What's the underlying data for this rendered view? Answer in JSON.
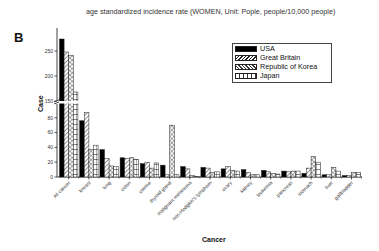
{
  "figure": {
    "panel_label": "B",
    "title": "age standardized incidence rate (WOMEN, Unit: Pople, people/10,000 people)"
  },
  "chart_data": {
    "type": "bar",
    "title": "age standardized incidence rate (WOMEN, Unit: Pople, people/10,000 people)",
    "xlabel": "Cancer",
    "ylabel": "Case",
    "axis_break": {
      "from": 100,
      "to": 150
    },
    "y_ticks_lower": [
      0,
      20,
      40,
      60,
      80
    ],
    "y_ticks_upper": [
      150,
      200,
      250
    ],
    "ylim": [
      0,
      280
    ],
    "grid": false,
    "legend_position": "upper right",
    "categories": [
      "All cancer",
      "breast",
      "lung",
      "colon",
      "uterine",
      "thyroid gland",
      "malignant melanoma",
      "non-Hodgkin's lymphom",
      "ovary",
      "kidney",
      "leukemia",
      "pancreas",
      "stomach",
      "liver",
      "gallbladder"
    ],
    "series": [
      {
        "name": "USA",
        "pattern": "solid-black",
        "values": [
          274,
          76,
          37,
          26,
          18,
          16,
          14,
          13,
          11,
          10,
          9,
          8,
          5,
          3,
          2
        ]
      },
      {
        "name": "Great Britain",
        "pattern": "diagonal-hatch",
        "values": [
          248,
          87,
          25,
          25,
          20,
          3,
          11,
          12,
          14,
          6,
          7,
          7,
          12,
          3,
          2
        ]
      },
      {
        "name": "Republic of Korea",
        "pattern": "cross-hatch",
        "values": [
          241,
          37,
          15,
          26,
          12,
          70,
          2,
          6,
          9,
          3,
          5,
          8,
          28,
          13,
          6
        ]
      },
      {
        "name": "Japan",
        "pattern": "vertical-lines",
        "values": [
          168,
          43,
          14,
          24,
          19,
          3,
          1,
          7,
          8,
          3,
          4,
          8,
          20,
          8,
          6
        ]
      }
    ]
  },
  "legend": {
    "items": [
      {
        "label": "USA"
      },
      {
        "label": "Great Britain"
      },
      {
        "label": "Republic of Korea"
      },
      {
        "label": "Japan"
      }
    ]
  }
}
